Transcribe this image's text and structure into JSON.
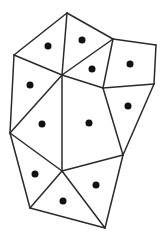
{
  "diagram": {
    "type": "polygon-subdivision",
    "width": 167,
    "height": 245,
    "colors": {
      "background": "#ffffff",
      "edge": "#2a2a2a",
      "dot": "#111111"
    },
    "vertices": {
      "A": [
        67,
        13
      ],
      "B": [
        14,
        55
      ],
      "C": [
        113,
        39
      ],
      "D": [
        156,
        45
      ],
      "E": [
        62,
        75
      ],
      "F": [
        103,
        88
      ],
      "G": [
        154,
        84
      ],
      "H": [
        10,
        133
      ],
      "I": [
        123,
        155
      ],
      "J": [
        62,
        171
      ],
      "K": [
        30,
        208
      ],
      "L": [
        105,
        228
      ]
    },
    "edges": [
      [
        "A",
        "B"
      ],
      [
        "A",
        "C"
      ],
      [
        "A",
        "E"
      ],
      [
        "B",
        "E"
      ],
      [
        "B",
        "H"
      ],
      [
        "C",
        "D"
      ],
      [
        "C",
        "E"
      ],
      [
        "C",
        "F"
      ],
      [
        "E",
        "F"
      ],
      [
        "D",
        "G"
      ],
      [
        "F",
        "G"
      ],
      [
        "G",
        "I"
      ],
      [
        "F",
        "I"
      ],
      [
        "E",
        "H"
      ],
      [
        "E",
        "J"
      ],
      [
        "H",
        "J"
      ],
      [
        "H",
        "K"
      ],
      [
        "J",
        "K"
      ],
      [
        "J",
        "I"
      ],
      [
        "J",
        "L"
      ],
      [
        "K",
        "L"
      ],
      [
        "I",
        "L"
      ]
    ],
    "dots": [
      [
        48,
        46
      ],
      [
        82,
        40
      ],
      [
        92,
        69
      ],
      [
        130,
        64
      ],
      [
        30,
        85
      ],
      [
        128,
        106
      ],
      [
        42,
        124
      ],
      [
        89,
        123
      ],
      [
        35,
        174
      ],
      [
        96,
        185
      ],
      [
        63,
        201
      ]
    ],
    "dot_radius": 3.5
  }
}
